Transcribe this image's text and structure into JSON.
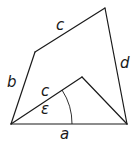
{
  "diagram": {
    "type": "geometry-quadrilateral",
    "vertices": {
      "bottom_left": [
        11,
        124
      ],
      "bottom_right": [
        127,
        124
      ],
      "upper_left": [
        35,
        52
      ],
      "top_right": [
        105,
        8
      ],
      "inner_apex": [
        82,
        77
      ]
    },
    "labels": {
      "top_side": "c",
      "left_side": "b",
      "right_side": "d",
      "inner_side": "c",
      "angle": "ε",
      "bottom_side": "a"
    },
    "colors": {
      "stroke": "#1a1a1a",
      "background": "#ffffff"
    }
  }
}
